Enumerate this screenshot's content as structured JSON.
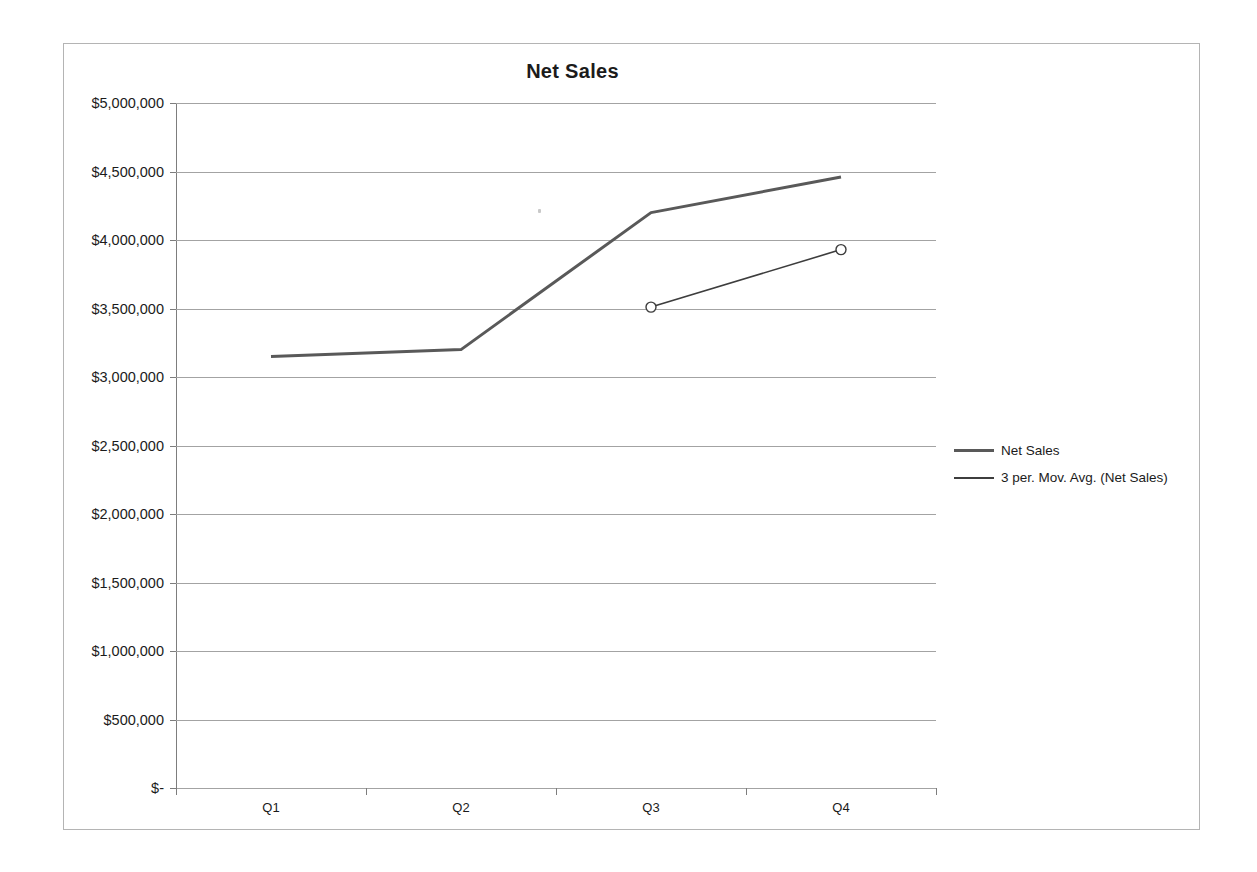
{
  "chart_data": {
    "type": "line",
    "title": "Net Sales",
    "xlabel": "",
    "ylabel": "",
    "categories": [
      "Q1",
      "Q2",
      "Q3",
      "Q4"
    ],
    "ylim": [
      0,
      5000000
    ],
    "ytick_values": [
      0,
      500000,
      1000000,
      1500000,
      2000000,
      2500000,
      3000000,
      3500000,
      4000000,
      4500000,
      5000000
    ],
    "ytick_labels": [
      "$-",
      "$500,000",
      "$1,000,000",
      "$1,500,000",
      "$2,000,000",
      "$2,500,000",
      "$3,000,000",
      "$3,500,000",
      "$4,000,000",
      "$4,500,000",
      "$5,000,000"
    ],
    "grid": true,
    "legend_position": "right",
    "series": [
      {
        "name": "Net Sales",
        "color": "#595959",
        "width": 3,
        "markers": false,
        "values": [
          3150000,
          3200000,
          4200000,
          4460000
        ]
      },
      {
        "name": "3 per. Mov. Avg. (Net Sales)",
        "color": "#3d3d3d",
        "width": 1.6,
        "markers": true,
        "values": [
          null,
          null,
          3510000,
          3930000
        ]
      }
    ]
  },
  "chart": {
    "title": "Net Sales",
    "y_axis": {
      "labels": [
        "$5,000,000",
        "$4,500,000",
        "$4,000,000",
        "$3,500,000",
        "$3,000,000",
        "$2,500,000",
        "$2,000,000",
        "$1,500,000",
        "$1,000,000",
        "$500,000",
        "$-"
      ]
    },
    "x_axis": {
      "labels": [
        "Q1",
        "Q2",
        "Q3",
        "Q4"
      ]
    },
    "legend": {
      "items": [
        {
          "label": "Net Sales"
        },
        {
          "label": "3 per. Mov. Avg. (Net Sales)"
        }
      ]
    }
  }
}
